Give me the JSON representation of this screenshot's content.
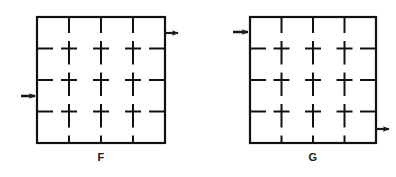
{
  "canvas": {
    "width": 396,
    "height": 177,
    "background": "#ffffff"
  },
  "style": {
    "stroke_color": "#111111",
    "border_stroke_width": 2.2,
    "grid_stroke_width": 2.0,
    "arrow_color": "#1a1a1a",
    "label_color": "#1a1a1a"
  },
  "figures": [
    {
      "id": "figure-f",
      "label": "F",
      "label_position": {
        "x": 101,
        "y": 158
      },
      "square": {
        "x": 37,
        "y": 17,
        "width": 128,
        "height": 126
      },
      "grid": {
        "columns": 4,
        "rows": 4,
        "interior_vertical_lines": 3,
        "interior_horizontal_lines": 3,
        "line_style": "dashed",
        "dash_pattern": "segments meeting at intersections forming plus shapes",
        "cell_width": 32,
        "cell_height": 31.5
      },
      "arrows": [
        {
          "name": "arrow-f-top-right",
          "direction": "right",
          "points": "outward",
          "edge": "right",
          "x": 165,
          "y": 33,
          "length": 16
        },
        {
          "name": "arrow-f-left-middle",
          "direction": "right",
          "points": "inward",
          "edge": "left",
          "x": 21,
          "y": 96,
          "length": 17
        }
      ]
    },
    {
      "id": "figure-g",
      "label": "G",
      "label_position": {
        "x": 313,
        "y": 158
      },
      "square": {
        "x": 250,
        "y": 17,
        "width": 126,
        "height": 126
      },
      "grid": {
        "columns": 4,
        "rows": 4,
        "interior_vertical_lines": 3,
        "interior_horizontal_lines": 3,
        "line_style": "dashed",
        "dash_pattern": "segments meeting at intersections forming plus shapes",
        "cell_width": 31.5,
        "cell_height": 31.5
      },
      "arrows": [
        {
          "name": "arrow-g-top-left",
          "direction": "right",
          "points": "inward",
          "edge": "left",
          "x": 233,
          "y": 32,
          "length": 17
        },
        {
          "name": "arrow-g-bottom-right",
          "direction": "right",
          "points": "outward",
          "edge": "right",
          "x": 376,
          "y": 129,
          "length": 16
        }
      ]
    }
  ]
}
